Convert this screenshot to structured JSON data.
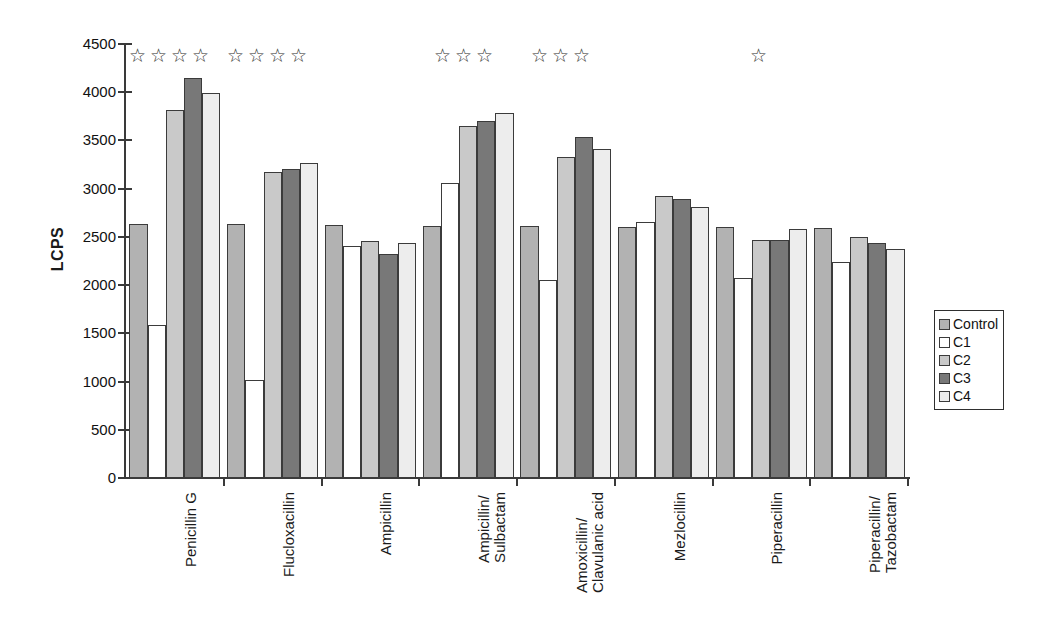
{
  "chart_data": {
    "type": "bar",
    "title": "",
    "xlabel": "",
    "ylabel": "LCPS",
    "ylim": [
      0,
      4500
    ],
    "ytick_step": 500,
    "yticks": [
      4500,
      4000,
      3500,
      3000,
      2500,
      2000,
      1500,
      1000,
      500,
      0
    ],
    "ytick_labels": [
      "4500",
      "4000",
      "3500",
      "3000",
      "2500",
      "2000",
      "1500",
      "1000",
      "500",
      "0"
    ],
    "grid": false,
    "legend_position": "right",
    "categories": [
      "Penicillin G",
      "Flucloxacillin",
      "Ampicillin",
      "Ampicillin/ Sulbactam",
      "Amoxicillin/ Clavulanic acid",
      "Mezlocillin",
      "Piperacillin",
      "Piperacillin/ Tazobactam"
    ],
    "category_lines": [
      [
        "Penicillin G"
      ],
      [
        "Flucloxacillin"
      ],
      [
        "Ampicillin"
      ],
      [
        "Ampicillin/",
        "Sulbactam"
      ],
      [
        "Amoxicillin/",
        "Clavulanic acid"
      ],
      [
        "Mezlocillin"
      ],
      [
        "Piperacillin"
      ],
      [
        "Piperacillin/",
        "Tazobactam"
      ]
    ],
    "series": [
      {
        "name": "Control",
        "color": "#b2b2b2",
        "values": [
          2630,
          2630,
          2620,
          2615,
          2610,
          2605,
          2600,
          2590
        ]
      },
      {
        "name": "C1",
        "color": "#ffffff",
        "values": [
          1590,
          1015,
          2410,
          3060,
          2050,
          2655,
          2075,
          2240
        ]
      },
      {
        "name": "C2",
        "color": "#c9c9c9",
        "values": [
          3820,
          3170,
          2460,
          3650,
          3330,
          2920,
          2465,
          2500
        ]
      },
      {
        "name": "C3",
        "color": "#787878",
        "values": [
          4150,
          3200,
          2320,
          3700,
          3535,
          2895,
          2465,
          2440
        ]
      },
      {
        "name": "C4",
        "color": "#ededed",
        "values": [
          3995,
          3265,
          2440,
          3780,
          3410,
          2805,
          2580,
          2370
        ]
      }
    ],
    "annotations": {
      "symbol": "☆",
      "meaning": "significance-stars",
      "stars_per_category": [
        4,
        4,
        0,
        3,
        3,
        0,
        1,
        0
      ]
    }
  },
  "legend": {
    "items": [
      {
        "label": "Control",
        "color": "#b2b2b2"
      },
      {
        "label": "C1",
        "color": "#ffffff"
      },
      {
        "label": "C2",
        "color": "#c9c9c9"
      },
      {
        "label": "C3",
        "color": "#787878"
      },
      {
        "label": "C4",
        "color": "#ededed"
      }
    ]
  }
}
